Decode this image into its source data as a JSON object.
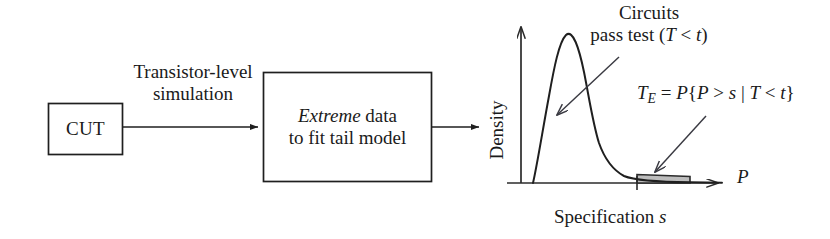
{
  "figure": {
    "type": "flow-diagram-with-density-plot"
  },
  "flow": {
    "blocks": [
      {
        "id": "cut",
        "label": "CUT"
      },
      {
        "id": "extreme",
        "label_italic": "Extreme",
        "label_rest": " data",
        "label_line2": "to fit tail model"
      }
    ],
    "edges": [
      {
        "id": "cut-to-extreme",
        "label_line1": "Transistor-level",
        "label_line2": "simulation"
      },
      {
        "id": "extreme-to-plot",
        "label": ""
      }
    ]
  },
  "plot": {
    "y_axis_label": "Density",
    "x_axis_label": "P",
    "x_caption": "Specification s",
    "annotations": [
      {
        "id": "circuits-pass-test",
        "line1": "Circuits",
        "line2_pre": "pass test (",
        "line2_var1": "T",
        "line2_op": " < ",
        "line2_var2": "t",
        "line2_post": ")"
      },
      {
        "id": "test-escape",
        "lhs_var": "T",
        "lhs_sub": "E",
        "eq": " = ",
        "prob": "P",
        "open": "{",
        "v1": "P",
        "op1": " > ",
        "v2": "s",
        "bar": " | ",
        "v3": "T",
        "op2": " < ",
        "v4": "t",
        "close": "}"
      }
    ]
  },
  "chart_data": {
    "type": "line",
    "title": "",
    "xlabel": "P",
    "ylabel": "Density",
    "grid": false,
    "legend": "none",
    "xlim": [
      0,
      1
    ],
    "ylim": [
      0,
      1
    ],
    "series": [
      {
        "name": "Density of performance P",
        "x": [
          0.055,
          0.075,
          0.095,
          0.115,
          0.14,
          0.17,
          0.2,
          0.215,
          0.23,
          0.25,
          0.27,
          0.3,
          0.33,
          0.37,
          0.42,
          0.47,
          0.53,
          0.6,
          0.68,
          0.76,
          0.84,
          0.92,
          1.0
        ],
        "y": [
          0.0,
          0.17,
          0.43,
          0.68,
          0.88,
          0.99,
          1.0,
          0.975,
          0.91,
          0.76,
          0.6,
          0.42,
          0.3,
          0.21,
          0.145,
          0.108,
          0.082,
          0.062,
          0.048,
          0.038,
          0.03,
          0.024,
          0.02
        ]
      }
    ],
    "shaded_region": {
      "name": "Test escape tail",
      "x_start": 0.795,
      "x_end": 1.0,
      "fill": "#bdbdbd",
      "stroke": "#2b2b2b"
    },
    "markers": [
      {
        "name": "specification-s-tick",
        "x": 0.795,
        "label": "s"
      }
    ],
    "annotations": [
      {
        "name": "circuits-pass-test",
        "points_to_x": 0.11,
        "points_to_y": 0.56
      },
      {
        "name": "test-escape",
        "points_to_x": 0.805,
        "points_to_y": 0.03
      }
    ]
  },
  "colors": {
    "ink": "#1a1a1a",
    "line": "#2b2b2b",
    "shade_fill": "#bdbdbd",
    "background": "#ffffff"
  }
}
